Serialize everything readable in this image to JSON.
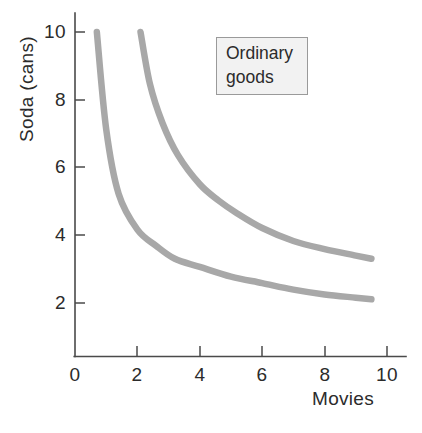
{
  "chart_data": {
    "type": "line",
    "title": "",
    "xlabel": "Movies",
    "ylabel": "Soda (cans)",
    "xlim": [
      0,
      10.6
    ],
    "ylim": [
      0,
      10.6
    ],
    "xticks": [
      "0",
      "2",
      "4",
      "6",
      "8",
      "10"
    ],
    "xtick_values": [
      0,
      2,
      4,
      6,
      8,
      10
    ],
    "yticks": [
      "2",
      "4",
      "6",
      "8",
      "10"
    ],
    "ytick_values": [
      2,
      4,
      6,
      8,
      10
    ],
    "grid": false,
    "legend_position": "upper-right-inside",
    "annotations": [
      {
        "name": "ordinary-goods-box",
        "lines": [
          "Ordinary",
          "goods"
        ]
      }
    ],
    "curve_color": "#a8a8a8",
    "axis_color": "#4a4a4a",
    "series": [
      {
        "name": "lower-indifference-curve",
        "note": "xy = 7",
        "points": [
          [
            0.7,
            10.0
          ],
          [
            1.0,
            7.0
          ],
          [
            1.4,
            5.0
          ],
          [
            2.0,
            3.9
          ],
          [
            2.6,
            3.4
          ],
          [
            3.2,
            3.0
          ],
          [
            4.0,
            2.75
          ],
          [
            5.0,
            2.45
          ],
          [
            6.0,
            2.25
          ],
          [
            7.0,
            2.05
          ],
          [
            8.0,
            1.9
          ],
          [
            9.0,
            1.8
          ],
          [
            9.5,
            1.75
          ]
        ]
      },
      {
        "name": "upper-indifference-curve",
        "note": "xy = 13",
        "points": [
          [
            2.1,
            10.0
          ],
          [
            2.4,
            8.4
          ],
          [
            2.8,
            7.2
          ],
          [
            3.3,
            6.2
          ],
          [
            4.0,
            5.3
          ],
          [
            4.6,
            4.8
          ],
          [
            5.2,
            4.4
          ],
          [
            6.0,
            3.95
          ],
          [
            7.0,
            3.55
          ],
          [
            8.0,
            3.3
          ],
          [
            9.0,
            3.1
          ],
          [
            9.5,
            3.0
          ]
        ]
      }
    ]
  },
  "axes": {
    "y_title": "Soda (cans)",
    "x_title": "Movies",
    "y_tick_labels": [
      "10",
      "8",
      "6",
      "4",
      "2"
    ],
    "x_tick_labels": [
      "0",
      "2",
      "4",
      "6",
      "8",
      "10"
    ]
  },
  "legend": {
    "line1": "Ordinary",
    "line2": "goods"
  }
}
